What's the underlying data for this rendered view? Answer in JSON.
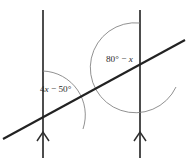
{
  "figure": {
    "type": "geometry-diagram",
    "background_color": "#ffffff",
    "line_color": "#2e2e2e",
    "transversal_color": "#222222",
    "arc_color": "#7d7d7d",
    "label_color": "#2b2b2b"
  },
  "labels": {
    "left_angle": {
      "full_text": "4x − 50°",
      "coefficient": "4",
      "variable": "x",
      "operator": "−",
      "constant": "50",
      "degree_symbol": "°",
      "prefix": "4",
      "suffix": " − 50°"
    },
    "right_angle": {
      "full_text": "80° − x",
      "constant": "80",
      "degree_symbol": "°",
      "operator": "−",
      "variable": "x",
      "prefix": "80° − ",
      "suffix": ""
    }
  },
  "geometry": {
    "left_line": {
      "x": 43,
      "y_top": 10,
      "y_bottom": 158
    },
    "right_line": {
      "x": 140,
      "y_top": 10,
      "y_bottom": 158
    },
    "transversal": {
      "x1": 3,
      "y1": 139,
      "x2": 185,
      "y2": 40
    },
    "left_intersection": {
      "x": 43,
      "y": 115
    },
    "right_intersection": {
      "x": 140,
      "y": 68
    },
    "arrow_markers": [
      {
        "line": "left",
        "x": 43,
        "y": 133,
        "direction": "up"
      },
      {
        "line": "right",
        "x": 140,
        "y": 133,
        "direction": "up"
      }
    ],
    "left_arc_radius": 44,
    "right_arc_radius": 45
  }
}
